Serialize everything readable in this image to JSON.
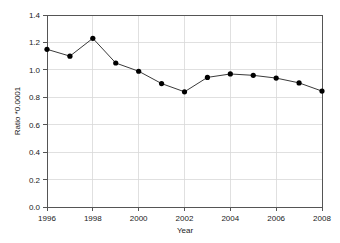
{
  "chart_data": {
    "type": "line",
    "title": "",
    "xlabel": "Year",
    "ylabel": "Ratio *0.0001",
    "x": [
      1996,
      1997,
      1998,
      1999,
      2000,
      2001,
      2002,
      2003,
      2004,
      2005,
      2006,
      2007,
      2008
    ],
    "values": [
      1.15,
      1.1,
      1.23,
      1.05,
      0.99,
      0.9,
      0.84,
      0.945,
      0.97,
      0.96,
      0.94,
      0.905,
      0.845
    ],
    "series": [
      {
        "name": "Ratio",
        "values": [
          1.15,
          1.1,
          1.23,
          1.05,
          0.99,
          0.9,
          0.84,
          0.945,
          0.97,
          0.96,
          0.94,
          0.905,
          0.845
        ]
      }
    ],
    "xlim": [
      1996,
      2008
    ],
    "ylim": [
      0.0,
      1.4
    ],
    "xticks": [
      1996,
      1998,
      2000,
      2002,
      2004,
      2006,
      2008
    ],
    "xtick_labels": [
      "1996",
      "1998",
      "2000",
      "2002",
      "2004",
      "2006",
      "2008"
    ],
    "yticks": [
      0.0,
      0.2,
      0.4,
      0.6,
      0.8,
      1.0,
      1.2,
      1.4
    ],
    "ytick_labels": [
      "0.0",
      "0.2",
      "0.4",
      "0.6",
      "0.8",
      "1.0",
      "1.2",
      "1.4"
    ],
    "grid": true,
    "grid_axis": "both",
    "legend": false,
    "legend_position": "none",
    "marker": "filled-circle",
    "line_color": "#3a3a3a",
    "marker_color": "#000000",
    "grid_color": "#d8d8d8",
    "axis_color": "#555555",
    "background_color": "#ffffff"
  },
  "axes": {
    "y_title": "Ratio *0.0001",
    "x_title": "Year"
  }
}
